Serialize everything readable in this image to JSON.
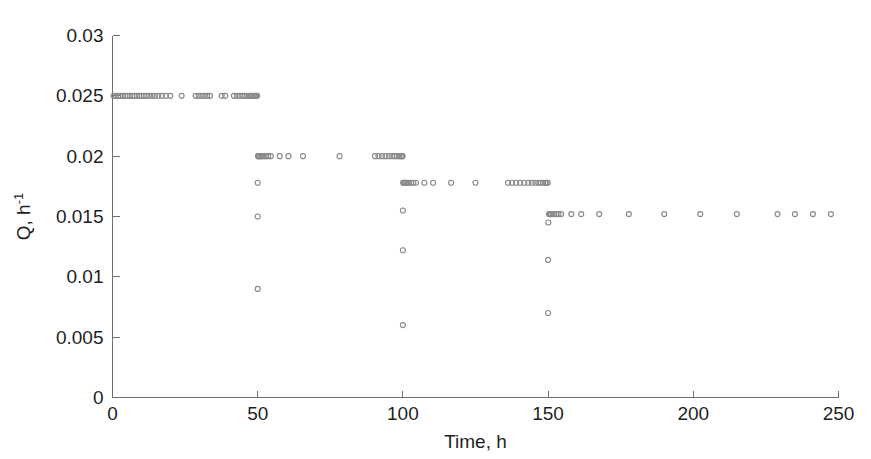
{
  "figure": {
    "background_color": "#ffffff",
    "marker_color": "#8a8a8a",
    "axis_color": "#6e6e6e",
    "text_color": "#1f1f1f"
  },
  "chart_data": {
    "type": "scatter",
    "title": "",
    "xlabel": "Time, h",
    "ylabel": "Q, h",
    "ylabel_exponent": "-1",
    "ylabel_full": "Q, h-1",
    "xlim": [
      0,
      250
    ],
    "ylim": [
      0,
      0.03
    ],
    "xticks": [
      0,
      50,
      100,
      150,
      200,
      250
    ],
    "xtick_labels": [
      "0",
      "50",
      "100",
      "150",
      "200",
      "250"
    ],
    "yticks": [
      0,
      0.005,
      0.01,
      0.015,
      0.02,
      0.025,
      0.03
    ],
    "ytick_labels": [
      "0",
      "0.005",
      "0.01",
      "0.015",
      "0.02",
      "0.025",
      "0.03"
    ],
    "grid": false,
    "legend": null,
    "marker_style": "open-circle",
    "marker_size_px": 5,
    "series": [
      {
        "name": "Dilution rate Q",
        "description": "Step-down dilution rate profile with transient drops at t = 50, 100 and 150 h",
        "points": [
          [
            0.4,
            0.025
          ],
          [
            1.2,
            0.025
          ],
          [
            2.0,
            0.025
          ],
          [
            2.8,
            0.025
          ],
          [
            3.6,
            0.025
          ],
          [
            4.4,
            0.025
          ],
          [
            5.2,
            0.025
          ],
          [
            6.0,
            0.025
          ],
          [
            6.8,
            0.025
          ],
          [
            7.6,
            0.025
          ],
          [
            8.4,
            0.025
          ],
          [
            9.2,
            0.025
          ],
          [
            10.0,
            0.025
          ],
          [
            10.8,
            0.025
          ],
          [
            11.6,
            0.025
          ],
          [
            12.6,
            0.025
          ],
          [
            13.6,
            0.025
          ],
          [
            14.6,
            0.025
          ],
          [
            15.8,
            0.025
          ],
          [
            17.0,
            0.025
          ],
          [
            18.4,
            0.025
          ],
          [
            19.9,
            0.025
          ],
          [
            23.8,
            0.025
          ],
          [
            28.6,
            0.025
          ],
          [
            29.6,
            0.025
          ],
          [
            30.6,
            0.025
          ],
          [
            31.6,
            0.025
          ],
          [
            32.6,
            0.025
          ],
          [
            33.6,
            0.025
          ],
          [
            37.6,
            0.025
          ],
          [
            38.8,
            0.025
          ],
          [
            41.8,
            0.025
          ],
          [
            42.8,
            0.025
          ],
          [
            43.8,
            0.025
          ],
          [
            44.8,
            0.025
          ],
          [
            45.6,
            0.025
          ],
          [
            46.4,
            0.025
          ],
          [
            47.1,
            0.025
          ],
          [
            47.7,
            0.025
          ],
          [
            48.2,
            0.025
          ],
          [
            48.7,
            0.025
          ],
          [
            49.1,
            0.025
          ],
          [
            49.5,
            0.025
          ],
          [
            49.8,
            0.025
          ],
          [
            50.0,
            0.009
          ],
          [
            50.0,
            0.015
          ],
          [
            50.0,
            0.0178
          ],
          [
            50.1,
            0.02
          ],
          [
            50.3,
            0.02
          ],
          [
            50.6,
            0.02
          ],
          [
            51.0,
            0.02
          ],
          [
            51.5,
            0.02
          ],
          [
            52.1,
            0.02
          ],
          [
            52.8,
            0.02
          ],
          [
            53.6,
            0.02
          ],
          [
            54.5,
            0.02
          ],
          [
            57.6,
            0.02
          ],
          [
            60.6,
            0.02
          ],
          [
            65.6,
            0.02
          ],
          [
            78.2,
            0.02
          ],
          [
            90.4,
            0.02
          ],
          [
            91.6,
            0.02
          ],
          [
            92.8,
            0.02
          ],
          [
            94.0,
            0.02
          ],
          [
            95.2,
            0.02
          ],
          [
            96.3,
            0.02
          ],
          [
            97.2,
            0.02
          ],
          [
            98.0,
            0.02
          ],
          [
            98.7,
            0.02
          ],
          [
            99.3,
            0.02
          ],
          [
            99.7,
            0.02
          ],
          [
            99.9,
            0.02
          ],
          [
            100.0,
            0.006
          ],
          [
            100.0,
            0.0122
          ],
          [
            100.0,
            0.0155
          ],
          [
            100.1,
            0.0178
          ],
          [
            100.3,
            0.0178
          ],
          [
            100.6,
            0.0178
          ],
          [
            101.0,
            0.0178
          ],
          [
            101.5,
            0.0178
          ],
          [
            102.1,
            0.0178
          ],
          [
            102.8,
            0.0178
          ],
          [
            103.6,
            0.0178
          ],
          [
            104.5,
            0.0178
          ],
          [
            107.4,
            0.0178
          ],
          [
            110.4,
            0.0178
          ],
          [
            116.6,
            0.0178
          ],
          [
            125.0,
            0.0178
          ],
          [
            136.2,
            0.0178
          ],
          [
            137.6,
            0.0178
          ],
          [
            139.0,
            0.0178
          ],
          [
            140.4,
            0.0178
          ],
          [
            141.8,
            0.0178
          ],
          [
            143.2,
            0.0178
          ],
          [
            144.4,
            0.0178
          ],
          [
            145.6,
            0.0178
          ],
          [
            146.6,
            0.0178
          ],
          [
            147.5,
            0.0178
          ],
          [
            148.3,
            0.0178
          ],
          [
            149.0,
            0.0178
          ],
          [
            149.5,
            0.0178
          ],
          [
            149.9,
            0.0178
          ],
          [
            150.0,
            0.007
          ],
          [
            150.0,
            0.0114
          ],
          [
            150.1,
            0.0145
          ],
          [
            150.3,
            0.0152
          ],
          [
            150.6,
            0.0152
          ],
          [
            151.0,
            0.0152
          ],
          [
            151.5,
            0.0152
          ],
          [
            152.1,
            0.0152
          ],
          [
            152.8,
            0.0152
          ],
          [
            153.6,
            0.0152
          ],
          [
            154.5,
            0.0152
          ],
          [
            158.0,
            0.0152
          ],
          [
            161.4,
            0.0152
          ],
          [
            167.6,
            0.0152
          ],
          [
            177.8,
            0.0152
          ],
          [
            190.0,
            0.0152
          ],
          [
            202.4,
            0.0152
          ],
          [
            215.0,
            0.0152
          ],
          [
            229.0,
            0.0152
          ],
          [
            235.0,
            0.0152
          ],
          [
            241.2,
            0.0152
          ],
          [
            247.4,
            0.0152
          ]
        ]
      }
    ]
  }
}
